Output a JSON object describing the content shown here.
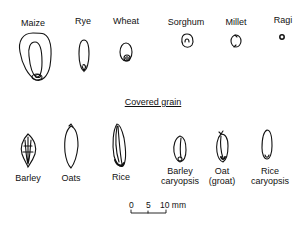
{
  "naked_grains": [
    {
      "label": "Maize",
      "x": 33,
      "y": 18
    },
    {
      "label": "Rye",
      "x": 83,
      "y": 16
    },
    {
      "label": "Wheat",
      "x": 126,
      "y": 16
    },
    {
      "label": "Sorghum",
      "x": 186,
      "y": 17
    },
    {
      "label": "Millet",
      "x": 236,
      "y": 17
    },
    {
      "label": "Ragi",
      "x": 283,
      "y": 15
    }
  ],
  "section_heading": "Covered grain",
  "covered_grains": [
    {
      "label": "Barley",
      "x": 28,
      "y": 197
    },
    {
      "label": "Oats",
      "x": 71,
      "y": 197
    },
    {
      "label": "Rice",
      "x": 122,
      "y": 196
    },
    {
      "label1": "Barley",
      "label2": "caryopsis",
      "x": 181,
      "y": 167
    },
    {
      "label1": "Oat",
      "label2": "(groat)",
      "x": 233,
      "y": 167
    },
    {
      "label1": "Rice",
      "label2": "caryopsis",
      "x": 286,
      "y": 167
    }
  ],
  "scale_bar": {
    "ticks": [
      "0",
      "5",
      "10 mm"
    ]
  }
}
